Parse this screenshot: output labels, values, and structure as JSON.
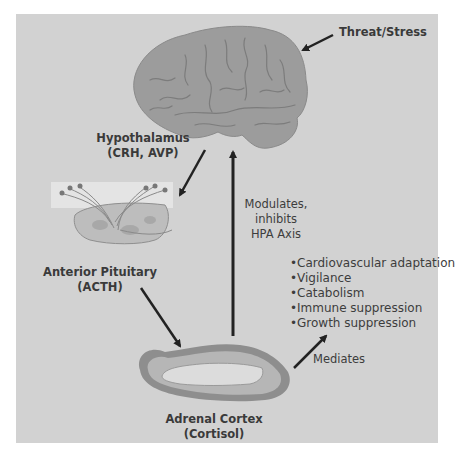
{
  "diagram": {
    "nodes": {
      "stressor": {
        "label": "Threat/Stress"
      },
      "hypothalamus": {
        "lines": [
          "Hypothalamus",
          "(CRH, AVP)"
        ]
      },
      "pituitary": {
        "lines": [
          "Anterior Pituitary",
          "(ACTH)"
        ]
      },
      "adrenal": {
        "lines": [
          "Adrenal Cortex",
          "(Cortisol)"
        ]
      }
    },
    "feedback": {
      "lines": [
        "Modulates,",
        "inhibits",
        "HPA Axis"
      ]
    },
    "mediates_label": "Mediates",
    "effects": [
      "Cardiovascular adaptation",
      "Vigilance",
      "Catabolism",
      "Immune suppression",
      "Growth suppression"
    ],
    "bullet": "•",
    "colors": {
      "panel_bg": "#d2d2d2",
      "brain": "#9c9c9c",
      "arrow": "#222222",
      "text": "#3a3a3a"
    },
    "icons": {
      "brain": "brain-illustration",
      "pituitary": "pituitary-gland-illustration",
      "adrenal": "adrenal-gland-illustration"
    }
  }
}
